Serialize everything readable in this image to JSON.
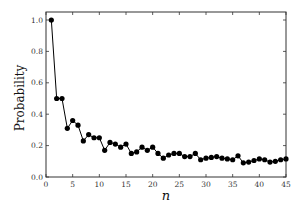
{
  "chart_data": {
    "type": "line",
    "title": "",
    "xlabel": "n",
    "ylabel": "Probability",
    "xlim": [
      0,
      45
    ],
    "ylim": [
      0.0,
      1.05
    ],
    "xticks": [
      0,
      5,
      10,
      15,
      20,
      25,
      30,
      35,
      40,
      45
    ],
    "yticks": [
      0.0,
      0.2,
      0.4,
      0.6,
      0.8,
      1.0
    ],
    "xtick_labels": [
      "0",
      "5",
      "10",
      "15",
      "20",
      "25",
      "30",
      "35",
      "40",
      "45"
    ],
    "ytick_labels": [
      "0.0",
      "0.2",
      "0.4",
      "0.6",
      "0.8",
      "1.0"
    ],
    "grid": false,
    "legend": null,
    "marker": "circle",
    "line_color": "#000000",
    "series": [
      {
        "name": "Probability",
        "x": [
          1,
          2,
          3,
          4,
          5,
          6,
          7,
          8,
          9,
          10,
          11,
          12,
          13,
          14,
          15,
          16,
          17,
          18,
          19,
          20,
          21,
          22,
          23,
          24,
          25,
          26,
          27,
          28,
          29,
          30,
          31,
          32,
          33,
          34,
          35,
          36,
          37,
          38,
          39,
          40,
          41,
          42,
          43,
          44,
          45
        ],
        "values": [
          1.0,
          0.5,
          0.5,
          0.31,
          0.36,
          0.33,
          0.23,
          0.27,
          0.25,
          0.25,
          0.17,
          0.22,
          0.21,
          0.19,
          0.21,
          0.15,
          0.16,
          0.19,
          0.17,
          0.19,
          0.15,
          0.12,
          0.14,
          0.15,
          0.15,
          0.13,
          0.13,
          0.15,
          0.11,
          0.12,
          0.125,
          0.13,
          0.12,
          0.115,
          0.11,
          0.135,
          0.09,
          0.095,
          0.105,
          0.115,
          0.11,
          0.095,
          0.1,
          0.11,
          0.115
        ]
      }
    ]
  }
}
